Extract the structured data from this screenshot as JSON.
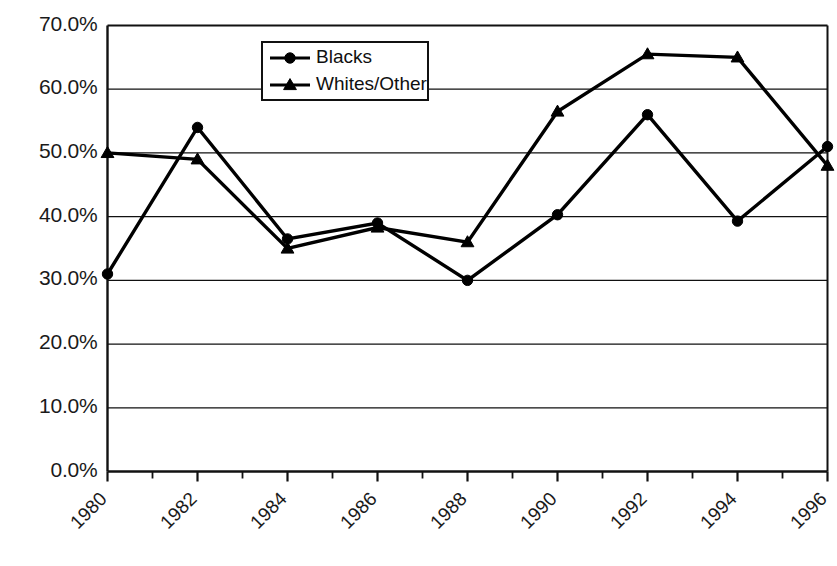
{
  "chart_data": {
    "type": "line",
    "title": "",
    "subtitle": "",
    "xlabel": "",
    "ylabel": "",
    "x": [
      1980,
      1981,
      1982,
      1983,
      1984,
      1985,
      1986,
      1987,
      1988
    ],
    "categories": [
      "1980",
      "1982",
      "1984",
      "1986",
      "1988",
      "1990",
      "1992",
      "1994",
      "1996"
    ],
    "x_tick_labels": [
      "1980",
      "1982",
      "1984",
      "1986",
      "1988",
      "1990",
      "1992",
      "1994",
      "1996"
    ],
    "x_minor_ticks": [
      "1981",
      "1983",
      "1985",
      "1987",
      "1989",
      "1991",
      "1993",
      "1995"
    ],
    "y_tick_labels": [
      "0.0%",
      "10.0%",
      "20.0%",
      "30.0%",
      "40.0%",
      "50.0%",
      "60.0%",
      "70.0%"
    ],
    "y_tick_values": [
      0,
      10,
      20,
      30,
      40,
      50,
      60,
      70
    ],
    "ylim": [
      0,
      70
    ],
    "grid": true,
    "grid_axis": "y",
    "legend_position": "top-center",
    "series": [
      {
        "name": "Blacks",
        "marker": "circle",
        "color": "#000000",
        "values": [
          31.0,
          54.0,
          36.5,
          39.0,
          30.0,
          40.3,
          56.0,
          39.3,
          51.0
        ]
      },
      {
        "name": "Whites/Other",
        "marker": "triangle",
        "color": "#000000",
        "values": [
          50.0,
          49.0,
          35.0,
          38.3,
          36.0,
          56.5,
          65.5,
          65.0,
          48.0
        ]
      }
    ]
  },
  "legend": {
    "entries": [
      {
        "label": "Blacks",
        "marker": "circle"
      },
      {
        "label": "Whites/Other",
        "marker": "triangle"
      }
    ]
  },
  "axes": {
    "y_labels": [
      "70.0%",
      "60.0%",
      "50.0%",
      "40.0%",
      "30.0%",
      "20.0%",
      "10.0%",
      "0.0%"
    ],
    "x_labels": [
      "1980",
      "1982",
      "1984",
      "1986",
      "1988",
      "1990",
      "1992",
      "1994",
      "1996"
    ]
  }
}
